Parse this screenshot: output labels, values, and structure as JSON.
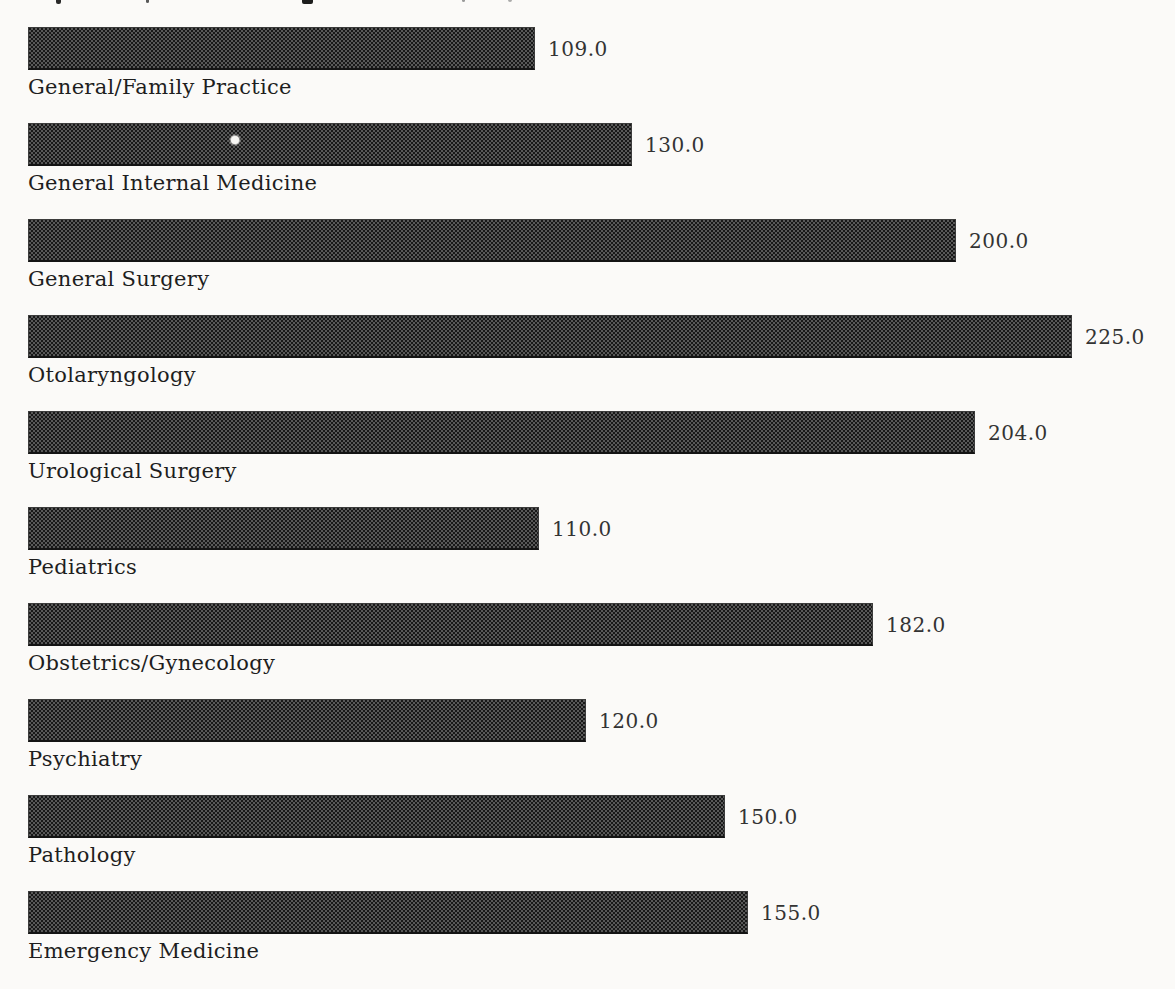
{
  "figure": {
    "background_color": "#fbfaf8",
    "note": "scanned print figure; chart title is cropped off at the top edge leaving only small descender marks"
  },
  "chart_data": {
    "type": "bar",
    "orientation": "horizontal",
    "title": "",
    "xlabel": "",
    "ylabel": "",
    "axes_visible": false,
    "gridlines": false,
    "legend": null,
    "value_label_position": "right-of-bar-end",
    "category_label_position": "below-bar",
    "scale_max_value": 225,
    "categories": [
      "General/Family Practice",
      "General Internal Medicine",
      "General Surgery",
      "Otolaryngology",
      "Urological Surgery",
      "Pediatrics",
      "Obstetrics/Gynecology",
      "Psychiatry",
      "Pathology",
      "Emergency Medicine"
    ],
    "values": [
      109.0,
      130.0,
      200.0,
      225.0,
      204.0,
      110.0,
      182.0,
      120.0,
      150.0,
      155.0
    ],
    "value_labels": [
      "109.0",
      "130.0",
      "200.0",
      "225.0",
      "204.0",
      "110.0",
      "182.0",
      "120.0",
      "150.0",
      "155.0"
    ],
    "bar_fill": {
      "style": "halftone-checker",
      "dark_color": "#181818",
      "light_color": "#585858",
      "edge_color": "#141414"
    },
    "value_label_color": "#333333",
    "category_label_color": "#1e1e1e"
  },
  "artifacts": {
    "white_dot_on_bar_2": {
      "x": 231,
      "y": 136,
      "diameter": 8
    },
    "clipped_title_marks": [
      {
        "x": 56,
        "w": 5,
        "h": 4,
        "color": "#2a2a2a"
      },
      {
        "x": 146,
        "w": 3,
        "h": 3,
        "color": "#5a5a5a"
      },
      {
        "x": 302,
        "w": 11,
        "h": 4,
        "color": "#1d1d1d"
      },
      {
        "x": 462,
        "w": 3,
        "h": 2,
        "color": "#9a9a9a"
      },
      {
        "x": 508,
        "w": 4,
        "h": 2,
        "color": "#ababab"
      }
    ]
  }
}
